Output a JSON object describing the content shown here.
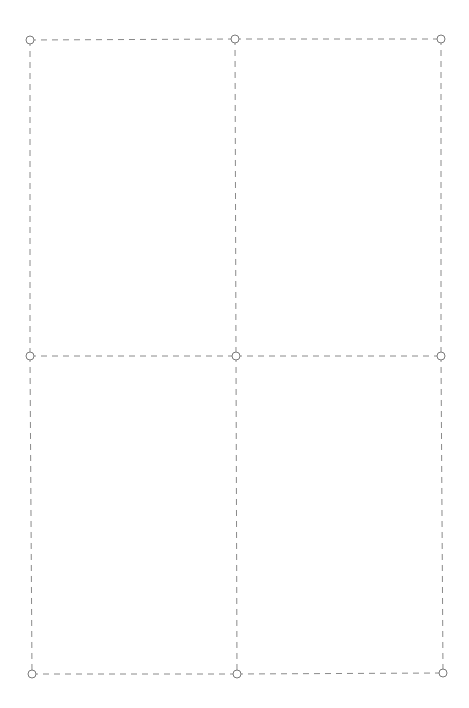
{
  "canvas": {
    "width": 469,
    "height": 708,
    "background": "#ffffff"
  },
  "style": {
    "line_color": "#8a8a8a",
    "dash": "6 5",
    "handle_radius": 4,
    "handle_stroke": "#7a7a7a",
    "handle_fill": "#ffffff"
  },
  "grid": {
    "points": [
      [
        [
          30,
          40
        ],
        [
          235,
          39
        ],
        [
          441,
          39
        ]
      ],
      [
        [
          30,
          356
        ],
        [
          236,
          356
        ],
        [
          441,
          356
        ]
      ],
      [
        [
          32,
          674
        ],
        [
          237,
          674
        ],
        [
          443,
          673
        ]
      ]
    ]
  }
}
